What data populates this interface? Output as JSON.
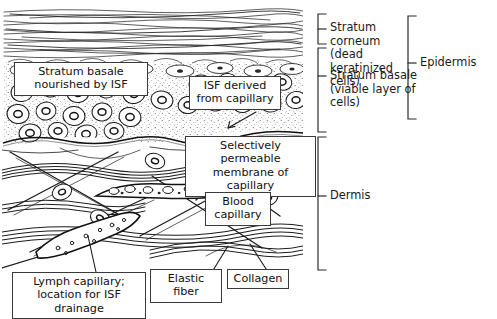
{
  "figure": {
    "ink_color": "#1a1a1a",
    "paper_color": "#ffffff"
  },
  "callouts": [
    {
      "id": "stratum-basale-isf",
      "text": "Stratum basale\nnourished by ISF"
    },
    {
      "id": "isf-derived",
      "text": "ISF derived\nfrom capillary"
    },
    {
      "id": "permeable-membrane",
      "text": "Selectively permeable\nmembrane of capillary"
    },
    {
      "id": "blood-capillary",
      "text": "Blood\ncapillary"
    },
    {
      "id": "lymph-capillary",
      "text": "Lymph capillary;\nlocation for ISF drainage"
    },
    {
      "id": "elastic-fiber",
      "text": "Elastic fiber"
    },
    {
      "id": "collagen",
      "text": "Collagen"
    }
  ],
  "brackets": [
    {
      "id": "stratum-corneum",
      "text": "Stratum corneum\n(dead keratinized\ncells)"
    },
    {
      "id": "stratum-basale",
      "text": "Stratum basale\n(viable layer of\ncells)"
    },
    {
      "id": "dermis",
      "text": "Dermis"
    },
    {
      "id": "epidermis",
      "text": "Epidermis"
    }
  ]
}
